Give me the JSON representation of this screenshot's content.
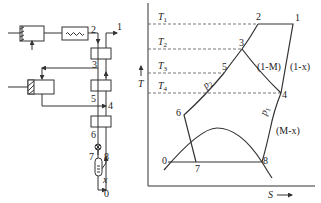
{
  "schematic": {
    "stream_labels": [
      "1",
      "2",
      "3",
      "4",
      "5",
      "6",
      "7",
      "8",
      "0"
    ],
    "outlet_label": "x",
    "components": [
      "compressor",
      "expander-1",
      "heater",
      "heat-exchanger-1",
      "expander-2",
      "heat-exchanger-2",
      "heat-exchanger-3",
      "throttle-valve",
      "separator"
    ]
  },
  "ts_diagram": {
    "y_axis_label": "T",
    "x_axis_label": "S",
    "temperature_levels": [
      "T1",
      "T2",
      "T3",
      "T4"
    ],
    "temperature_labels": {
      "T1": "T",
      "T1s": "1",
      "T2": "T",
      "T2s": "2",
      "T3": "T",
      "T3s": "3",
      "T4": "T",
      "T4s": "4"
    },
    "points": {
      "p1": "1",
      "p2": "2",
      "p3": "3",
      "p4": "4",
      "p5": "5",
      "p6": "6",
      "p7": "7",
      "p8": "8",
      "p0": "0"
    },
    "branch_labels": {
      "one_minus_M": "(1-M)",
      "one_minus_x": "(1-x)",
      "M_minus_x": "(M-x)",
      "p1_isobar": "p",
      "p1_sub": "1",
      "p2_isobar": "p",
      "p2_sub": "2"
    }
  }
}
